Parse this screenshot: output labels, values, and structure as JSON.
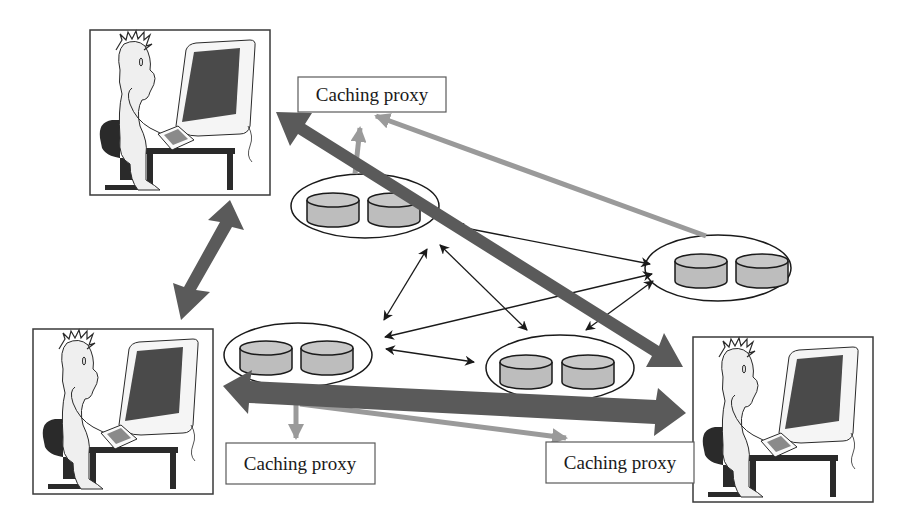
{
  "diagram": {
    "type": "network-architecture",
    "colors": {
      "background": "#ffffff",
      "user_link": "#5a5a5a",
      "proxy_link": "#9a9a9a",
      "server_link": "#1a1a1a",
      "disk_fill": "#bdbdbd",
      "outline": "#1a1a1a",
      "monitor_screen": "#4a4a4a"
    },
    "proxies": [
      {
        "id": "proxy-top",
        "label": "Caching proxy"
      },
      {
        "id": "proxy-bottom-left",
        "label": "Caching proxy"
      },
      {
        "id": "proxy-bottom-right",
        "label": "Caching proxy"
      }
    ],
    "users": [
      {
        "id": "user-top-left"
      },
      {
        "id": "user-bottom-left"
      },
      {
        "id": "user-bottom-right"
      }
    ],
    "server_clusters": [
      {
        "id": "cluster-a",
        "disks": 2
      },
      {
        "id": "cluster-b",
        "disks": 2
      },
      {
        "id": "cluster-c",
        "disks": 2
      },
      {
        "id": "cluster-d",
        "disks": 2
      }
    ]
  }
}
